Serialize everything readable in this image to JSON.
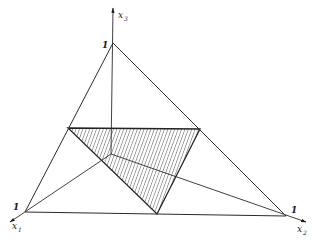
{
  "diagram": {
    "type": "simplex-3d",
    "axes": [
      {
        "name": "x1",
        "label": "x",
        "sub": "1",
        "unit_label": "1"
      },
      {
        "name": "x2",
        "label": "x",
        "sub": "2",
        "unit_label": "1"
      },
      {
        "name": "x3",
        "label": "x",
        "sub": "3",
        "unit_label": "1"
      }
    ],
    "points": {
      "origin": [
        111,
        154
      ],
      "x1_unit": [
        25,
        212
      ],
      "x2_unit": [
        286,
        216
      ],
      "x3_unit": [
        113,
        43
      ],
      "x1_axis_end": [
        10,
        222
      ],
      "x2_axis_end": [
        306,
        222
      ],
      "x3_axis_end": [
        113,
        8
      ],
      "hatch_left": [
        68,
        128
      ],
      "hatch_right": [
        200,
        129
      ],
      "hatch_bottom": [
        157,
        214
      ]
    },
    "colors": {
      "line": "#2a2a2a",
      "hatch": "#3a3a3a",
      "background": "#ffffff"
    }
  }
}
